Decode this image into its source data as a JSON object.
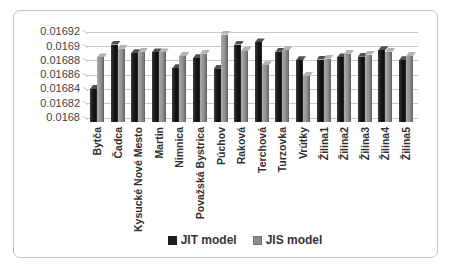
{
  "chart_data": {
    "type": "bar",
    "title": "",
    "xlabel": "",
    "ylabel": "",
    "categories": [
      "Bytča",
      "Čadca",
      "Kysucké Nové Mesto",
      "Martin",
      "Nimnica",
      "Považská Bystrica",
      "Púchov",
      "Raková",
      "Terchová",
      "Turzovka",
      "Vrútky",
      "Žilina1",
      "Žilina2",
      "Žilina3",
      "Žilina4",
      "Žilina5"
    ],
    "series": [
      {
        "name": "JIT model",
        "color": "#1c1c1c",
        "values": [
          0.01684,
          0.016902,
          0.01689,
          0.016891,
          0.016869,
          0.016883,
          0.016868,
          0.016902,
          0.016905,
          0.016892,
          0.01688,
          0.016881,
          0.016884,
          0.016885,
          0.016894,
          0.01688
        ]
      },
      {
        "name": "JIS model",
        "color": "#8c8c8c",
        "values": [
          0.016884,
          0.016896,
          0.016892,
          0.016891,
          0.016886,
          0.016889,
          0.016916,
          0.016893,
          0.016873,
          0.016894,
          0.016858,
          0.016882,
          0.016889,
          0.016888,
          0.016892,
          0.016886
        ]
      }
    ],
    "ylim": [
      0.0168,
      0.01692
    ],
    "yticks": [
      {
        "value": 0.0168,
        "label": "0.0168"
      },
      {
        "value": 0.01682,
        "label": "0.01682"
      },
      {
        "value": 0.01684,
        "label": "0.01684"
      },
      {
        "value": 0.01686,
        "label": "0.01686"
      },
      {
        "value": 0.01688,
        "label": "0.01688"
      },
      {
        "value": 0.0169,
        "label": "0.0169"
      },
      {
        "value": 0.01692,
        "label": "0.01692"
      }
    ],
    "grid": true,
    "legend_position": "bottom"
  },
  "legend": {
    "jit_label": "JIT model",
    "jis_label": "JIS model"
  }
}
